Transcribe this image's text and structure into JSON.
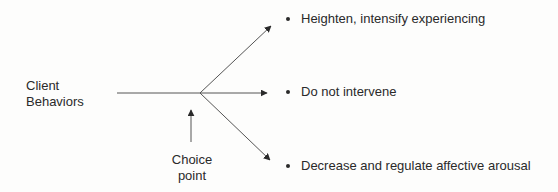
{
  "diagram": {
    "source_label": {
      "line1": "Client",
      "line2": "Behaviors"
    },
    "choice_label": {
      "line1": "Choice",
      "line2": "point"
    },
    "options": [
      {
        "label": "Heighten, intensify experiencing"
      },
      {
        "label": "Do not intervene"
      },
      {
        "label": "Decrease and regulate affective arousal"
      }
    ],
    "colors": {
      "line": "#555555",
      "text": "#2a2a2a",
      "background": "#fdfdfc"
    }
  }
}
